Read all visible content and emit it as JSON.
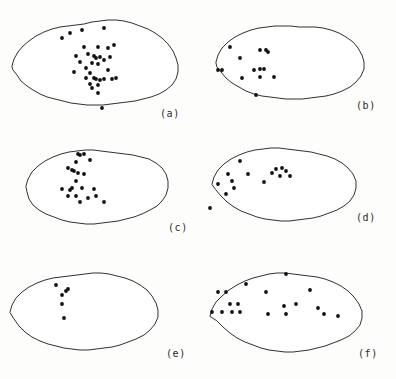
{
  "figure": {
    "type": "spatial-point-pattern-panels",
    "panel_count": 6,
    "columns": 2,
    "rows": 3,
    "background_color": "#fdfdfc",
    "outline_color": "#1a1a1a",
    "dot_color": "#111111",
    "dot_radius": 1.9
  },
  "chart_data": {
    "type": "scatter",
    "title": "",
    "subtitle": "",
    "xlabel": "",
    "ylabel": "",
    "grid": false,
    "legend": "none",
    "xlim": [
      0,
      198
    ],
    "ylim": [
      0,
      126
    ],
    "panels": [
      {
        "label": "(a)",
        "label_x": 160,
        "label_y": 108,
        "n_points": 34,
        "outline": "M 12,66 L 14,59 L 18,52 L 23,46 L 29,41 L 36,36 L 44,32 L 52,29 L 60,27 L 68,26 L 76,25 L 84,24 L 92,22 L 100,21 L 108,20 L 116,20 L 124,21 L 132,23 L 140,26 L 148,29 L 155,33 L 162,38 L 168,44 L 173,51 L 176,58 L 178,65 L 178,72 L 176,79 L 172,85 L 166,90 L 159,94 L 151,97 L 143,99 L 135,101 L 127,102 L 119,103 L 111,104 L 103,105 L 95,105 L 87,105 L 79,104 L 71,103 L 63,101 L 55,99 L 47,97 L 40,94 L 33,90 L 27,86 L 21,81 L 17,75 L 13,70 Z",
        "points": [
          [
            70,
            33
          ],
          [
            82,
            30
          ],
          [
            104,
            28
          ],
          [
            62,
            38
          ],
          [
            84,
            47
          ],
          [
            98,
            47
          ],
          [
            108,
            48
          ],
          [
            114,
            45
          ],
          [
            76,
            56
          ],
          [
            88,
            54
          ],
          [
            94,
            56
          ],
          [
            96,
            58
          ],
          [
            100,
            57
          ],
          [
            104,
            60
          ],
          [
            110,
            57
          ],
          [
            80,
            62
          ],
          [
            92,
            63
          ],
          [
            98,
            64
          ],
          [
            86,
            68
          ],
          [
            74,
            72
          ],
          [
            90,
            73
          ],
          [
            108,
            70
          ],
          [
            86,
            78
          ],
          [
            94,
            78
          ],
          [
            96,
            79
          ],
          [
            100,
            80
          ],
          [
            104,
            79
          ],
          [
            112,
            79
          ],
          [
            116,
            78
          ],
          [
            90,
            84
          ],
          [
            98,
            85
          ],
          [
            92,
            88
          ],
          [
            98,
            93
          ],
          [
            102,
            108
          ]
        ]
      },
      {
        "label": "(b)",
        "label_x": 158,
        "label_y": 100,
        "n_points": 13,
        "outline": "M 18,62 L 20,55 L 24,48 L 30,42 L 37,37 L 45,33 L 53,30 L 61,28 L 69,27 L 77,26 L 85,26 L 93,26 L 101,27 L 109,27 L 117,27 L 125,28 L 133,30 L 141,33 L 148,37 L 155,42 L 160,48 L 164,55 L 166,62 L 166,69 L 163,76 L 158,82 L 152,87 L 144,91 L 136,94 L 128,96 L 120,97 L 112,98 L 104,99 L 96,99 L 88,99 L 80,98 L 72,97 L 64,96 L 56,94 L 48,91 L 41,87 L 34,83 L 28,78 L 23,72 L 19,67 Z",
        "points": [
          [
            32,
            47
          ],
          [
            62,
            50
          ],
          [
            68,
            50
          ],
          [
            70,
            52
          ],
          [
            42,
            58
          ],
          [
            20,
            70
          ],
          [
            24,
            70
          ],
          [
            56,
            70
          ],
          [
            62,
            69
          ],
          [
            66,
            69
          ],
          [
            44,
            78
          ],
          [
            62,
            77
          ],
          [
            76,
            77
          ],
          [
            58,
            95
          ]
        ]
      },
      {
        "label": "(c)",
        "label_x": 168,
        "label_y": 96,
        "n_points": 22,
        "outline": "M 26,60 L 28,53 L 32,46 L 38,40 L 45,35 L 53,31 L 61,28 L 69,26 L 77,25 L 85,24 L 93,24 L 101,25 L 109,26 L 117,27 L 125,28 L 133,29 L 141,31 L 149,33 L 156,37 L 162,42 L 166,48 L 168,55 L 168,62 L 166,69 L 162,75 L 157,80 L 150,84 L 142,88 L 134,91 L 126,93 L 118,95 L 110,96 L 102,97 L 94,98 L 86,98 L 78,97 L 70,96 L 62,94 L 54,91 L 46,88 L 39,84 L 33,79 L 29,73 L 27,66 Z",
        "points": [
          [
            78,
            28
          ],
          [
            80,
            29
          ],
          [
            84,
            28
          ],
          [
            76,
            36
          ],
          [
            90,
            34
          ],
          [
            68,
            42
          ],
          [
            72,
            44
          ],
          [
            74,
            45
          ],
          [
            78,
            47
          ],
          [
            84,
            48
          ],
          [
            76,
            55
          ],
          [
            62,
            63
          ],
          [
            72,
            62
          ],
          [
            82,
            62
          ],
          [
            94,
            63
          ],
          [
            68,
            70
          ],
          [
            76,
            70
          ],
          [
            88,
            72
          ],
          [
            96,
            70
          ],
          [
            80,
            76
          ],
          [
            104,
            76
          ],
          [
            70,
            64
          ]
        ]
      },
      {
        "label": "(d)",
        "label_x": 158,
        "label_y": 86,
        "n_points": 15,
        "outline": "M 14,58 L 16,51 L 20,44 L 26,38 L 33,33 L 41,29 L 49,26 L 57,24 L 65,23 L 73,22 L 81,22 L 89,23 L 97,24 L 105,25 L 113,26 L 121,28 L 129,30 L 137,33 L 144,37 L 150,42 L 155,48 L 158,55 L 158,62 L 156,69 L 152,75 L 146,80 L 139,84 L 131,87 L 123,90 L 115,92 L 107,93 L 99,94 L 91,95 L 83,95 L 75,94 L 67,93 L 59,91 L 51,88 L 43,85 L 36,81 L 29,76 L 23,70 L 18,64 Z",
        "points": [
          [
            42,
            35
          ],
          [
            78,
            43
          ],
          [
            84,
            42
          ],
          [
            88,
            45
          ],
          [
            30,
            48
          ],
          [
            50,
            48
          ],
          [
            74,
            47
          ],
          [
            82,
            50
          ],
          [
            92,
            50
          ],
          [
            34,
            55
          ],
          [
            20,
            58
          ],
          [
            36,
            62
          ],
          [
            28,
            68
          ],
          [
            12,
            82
          ],
          [
            66,
            56
          ]
        ]
      },
      {
        "label": "(e)",
        "label_x": 166,
        "label_y": 96,
        "n_points": 6,
        "outline": "M 10,60 L 12,53 L 16,46 L 22,40 L 29,35 L 37,31 L 45,28 L 53,26 L 61,25 L 69,24 L 77,23 L 85,22 L 93,21 L 101,21 L 109,22 L 117,24 L 125,26 L 133,29 L 140,33 L 147,38 L 152,44 L 156,51 L 158,58 L 158,65 L 155,72 L 150,78 L 144,83 L 136,87 L 128,90 L 120,93 L 112,95 L 104,96 L 96,97 L 88,98 L 80,98 L 72,97 L 64,96 L 56,94 L 48,92 L 40,89 L 32,85 L 25,80 L 19,74 L 14,67 Z",
        "points": [
          [
            56,
            33
          ],
          [
            66,
            39
          ],
          [
            68,
            37
          ],
          [
            62,
            43
          ],
          [
            62,
            52
          ],
          [
            64,
            66
          ]
        ]
      },
      {
        "label": "(f)",
        "label_x": 160,
        "label_y": 96,
        "n_points": 21,
        "outline": "M 12,64 L 14,57 L 18,50 L 24,44 L 31,38 L 39,33 L 47,29 L 55,26 L 63,24 L 71,22 L 79,21 L 87,21 L 95,22 L 103,23 L 111,24 L 119,25 L 127,27 L 135,30 L 143,34 L 150,39 L 156,45 L 161,52 L 164,59 L 164,66 L 162,73 L 157,79 L 151,84 L 143,88 L 135,91 L 127,94 L 119,96 L 111,98 L 103,99 L 95,100 L 87,100 L 79,99 L 71,98 L 63,96 L 55,93 L 47,90 L 39,86 L 32,81 L 25,75 L 19,69 Z",
        "points": [
          [
            88,
            22
          ],
          [
            48,
            32
          ],
          [
            20,
            40
          ],
          [
            28,
            40
          ],
          [
            68,
            40
          ],
          [
            112,
            38
          ],
          [
            32,
            52
          ],
          [
            40,
            52
          ],
          [
            98,
            52
          ],
          [
            86,
            54
          ],
          [
            14,
            60
          ],
          [
            24,
            60
          ],
          [
            34,
            60
          ],
          [
            42,
            60
          ],
          [
            120,
            56
          ],
          [
            126,
            62
          ],
          [
            70,
            62
          ],
          [
            88,
            62
          ],
          [
            140,
            64
          ]
        ]
      }
    ]
  }
}
